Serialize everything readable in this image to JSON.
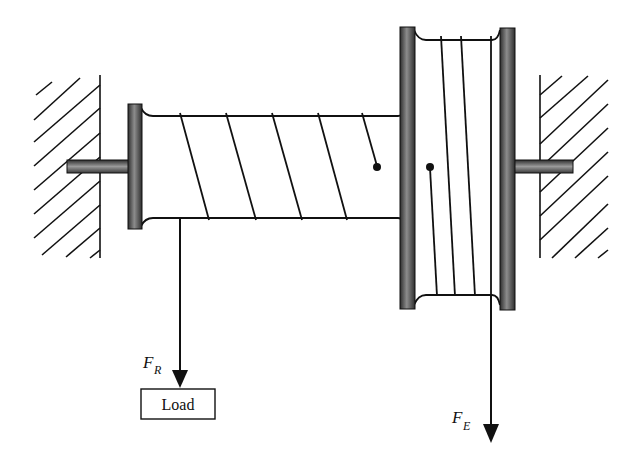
{
  "diagram": {
    "type": "differential windlass / wheel and axle with two drums",
    "labels": {
      "load_force": {
        "main": "F",
        "subscript": "R"
      },
      "effort_force": {
        "main": "F",
        "subscript": "E"
      },
      "load_box": "Load"
    },
    "components": [
      "left-wall",
      "right-wall",
      "left-axle",
      "right-axle",
      "small-drum",
      "large-drum",
      "rope-coils",
      "load-arrow",
      "effort-arrow",
      "load-box"
    ],
    "colors": {
      "line": "#111111",
      "flange_dark": "#3a3a3a",
      "flange_light": "#9a9a9a",
      "background": "#ffffff"
    }
  }
}
